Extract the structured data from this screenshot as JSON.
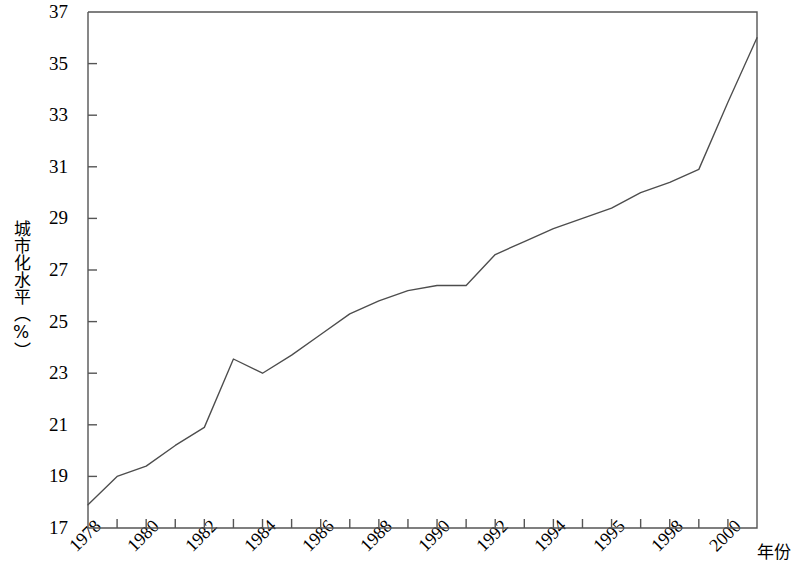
{
  "chart_data": {
    "type": "line",
    "title": "",
    "xlabel": "年份",
    "ylabel": "城市化水平（%）",
    "ylim": [
      17,
      37
    ],
    "xlim": [
      1978,
      2001
    ],
    "grid": false,
    "legend": null,
    "y_ticks": [
      17,
      19,
      21,
      23,
      25,
      27,
      29,
      31,
      33,
      35,
      37
    ],
    "y_tick_labels": [
      "17",
      "19",
      "21",
      "23",
      "25",
      "27",
      "29",
      "31",
      "33",
      "35",
      "37"
    ],
    "x_tick_labels": [
      "1978",
      "1980",
      "1982",
      "1984",
      "1986",
      "1988",
      "1990",
      "1992",
      "1994",
      "1995",
      "1998",
      "2000"
    ],
    "x_tick_label_years": [
      1978,
      1980,
      1982,
      1984,
      1986,
      1988,
      1990,
      1992,
      1994,
      1996,
      1998,
      2000
    ],
    "x_minor_tick_years": [
      1978,
      1979,
      1980,
      1981,
      1982,
      1983,
      1984,
      1985,
      1986,
      1987,
      1988,
      1989,
      1990,
      1991,
      1992,
      1993,
      1994,
      1995,
      1996,
      1997,
      1998,
      1999,
      2000,
      2001
    ],
    "line_color": "#4d4d4d",
    "axis_color": "#555555",
    "x": [
      1978,
      1979,
      1980,
      1981,
      1982,
      1983,
      1984,
      1985,
      1986,
      1987,
      1988,
      1989,
      1990,
      1991,
      1992,
      1993,
      1994,
      1995,
      1996,
      1997,
      1998,
      1999,
      2000,
      2001
    ],
    "values": [
      17.9,
      19.0,
      19.4,
      20.2,
      20.9,
      23.55,
      23.0,
      23.7,
      24.5,
      25.3,
      25.8,
      26.2,
      26.4,
      26.4,
      27.6,
      28.1,
      28.6,
      29.0,
      29.4,
      30.0,
      30.4,
      30.9,
      33.5,
      36.0
    ]
  },
  "ui": {
    "figure_name": "城市化水平折线图"
  }
}
